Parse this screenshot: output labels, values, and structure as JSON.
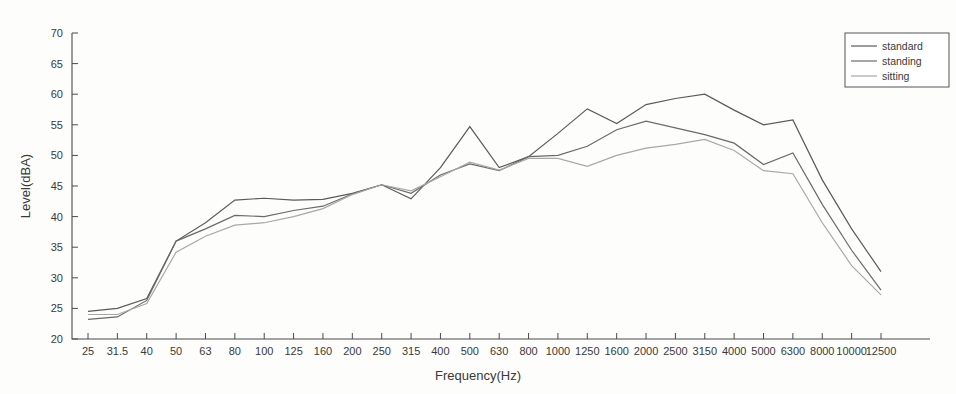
{
  "chart_data": {
    "type": "line",
    "title": "",
    "xlabel": "Frequency(Hz)",
    "ylabel": "Level(dBA)",
    "categories": [
      "25",
      "31.5",
      "40",
      "50",
      "63",
      "80",
      "100",
      "125",
      "160",
      "200",
      "250",
      "315",
      "400",
      "500",
      "630",
      "800",
      "1000",
      "1250",
      "1600",
      "2000",
      "2500",
      "3150",
      "4000",
      "5000",
      "6300",
      "8000",
      "10000",
      "12500"
    ],
    "xscale": "category (one-third octave bands)",
    "ylim": [
      20,
      70
    ],
    "yticks": [
      20,
      25,
      30,
      35,
      40,
      45,
      50,
      55,
      60,
      65,
      70
    ],
    "grid": false,
    "legend_position": "top-right",
    "series": [
      {
        "name": "standard",
        "color": "#5a5a5a",
        "values": [
          24.5,
          25.0,
          26.6,
          36.0,
          39.0,
          42.7,
          43.0,
          42.7,
          42.8,
          43.8,
          45.2,
          42.9,
          48.0,
          54.7,
          48.0,
          49.8,
          53.6,
          57.6,
          55.2,
          58.3,
          59.3,
          60.0,
          57.4,
          55.0,
          55.8,
          46.0,
          38.0,
          31.0
        ]
      },
      {
        "name": "standing",
        "color": "#6a6a6a",
        "values": [
          23.2,
          23.6,
          26.3,
          36.0,
          38.0,
          40.2,
          40.0,
          41.0,
          41.7,
          43.7,
          45.2,
          43.8,
          46.8,
          48.6,
          47.5,
          49.8,
          50.0,
          51.5,
          54.2,
          55.6,
          54.5,
          53.4,
          52.0,
          48.5,
          50.4,
          42.0,
          34.5,
          28.0
        ]
      },
      {
        "name": "sitting",
        "color": "#a8a8a8",
        "values": [
          24.0,
          24.0,
          25.8,
          34.2,
          36.8,
          38.6,
          39.0,
          40.0,
          41.3,
          43.6,
          45.2,
          44.2,
          46.5,
          48.9,
          47.6,
          49.5,
          49.5,
          48.2,
          50.0,
          51.2,
          51.8,
          52.6,
          50.8,
          47.5,
          47.0,
          39.0,
          32.0,
          27.2
        ]
      }
    ]
  },
  "axes": {
    "x_title": "Frequency(Hz)",
    "y_title": "Level(dBA)"
  },
  "legend": {
    "items": [
      {
        "label": "standard"
      },
      {
        "label": "standing"
      },
      {
        "label": "sitting"
      }
    ]
  }
}
